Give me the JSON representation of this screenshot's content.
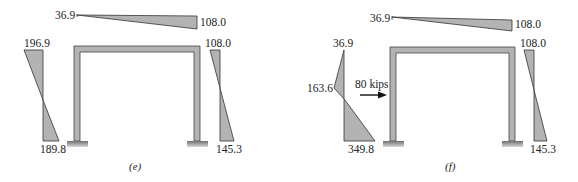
{
  "colors": {
    "fill": "#b3b3b3",
    "stroke": "#333333",
    "support": "#8a8a8a"
  },
  "panels": [
    {
      "caption": "(e)",
      "beam": {
        "left": "36.9",
        "right": "108.0"
      },
      "left_column": {
        "top": "196.9",
        "bottom": "189.8"
      },
      "right_column": {
        "top": "108.0",
        "bottom": "145.3"
      }
    },
    {
      "caption": "(f)",
      "beam": {
        "left": "36.9",
        "right": "108.0"
      },
      "left_column": {
        "top": "36.9",
        "mid": "163.6",
        "bottom": "349.8"
      },
      "right_column": {
        "top": "108.0",
        "bottom": "145.3"
      },
      "load": {
        "label": "80 kips"
      }
    }
  ]
}
